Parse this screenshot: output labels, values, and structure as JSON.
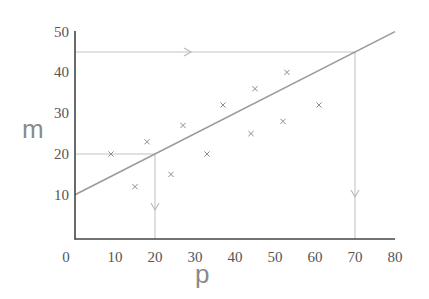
{
  "chart_data": {
    "type": "scatter",
    "title": "",
    "xlabel": "p",
    "ylabel": "m",
    "xlim": [
      0,
      80
    ],
    "ylim": [
      0,
      50
    ],
    "grid": false,
    "legend": null,
    "x_ticks": [
      0,
      10,
      20,
      30,
      40,
      50,
      60,
      70,
      80
    ],
    "x_tick_labels": [
      "0",
      "10",
      "20",
      "30",
      "40",
      "50",
      "60",
      "70",
      "80"
    ],
    "y_ticks": [
      10,
      20,
      30,
      40,
      50
    ],
    "y_tick_labels": [
      "10",
      "20",
      "30",
      "40",
      "50"
    ],
    "series": [
      {
        "name": "observations",
        "marker": "x",
        "points": [
          {
            "x": 9,
            "y": 20
          },
          {
            "x": 15,
            "y": 12
          },
          {
            "x": 18,
            "y": 23
          },
          {
            "x": 24,
            "y": 15
          },
          {
            "x": 27,
            "y": 27
          },
          {
            "x": 33,
            "y": 20
          },
          {
            "x": 37,
            "y": 32
          },
          {
            "x": 44,
            "y": 25
          },
          {
            "x": 45,
            "y": 36
          },
          {
            "x": 52,
            "y": 28
          },
          {
            "x": 53,
            "y": 40
          },
          {
            "x": 61,
            "y": 32
          }
        ]
      }
    ],
    "regression_line": {
      "name": "line of best fit",
      "from": {
        "x": 0,
        "y": 10
      },
      "to": {
        "x": 80,
        "y": 50
      },
      "slope": 0.5,
      "intercept": 10
    },
    "annotations": [
      {
        "type": "interpolation-guide",
        "description": "from m=20 across to line, then down to p=20",
        "m": 20,
        "p": 20
      },
      {
        "type": "extrapolation-guide",
        "description": "from m=45 across to line, then down to p=70",
        "m": 45,
        "p": 70
      }
    ]
  }
}
